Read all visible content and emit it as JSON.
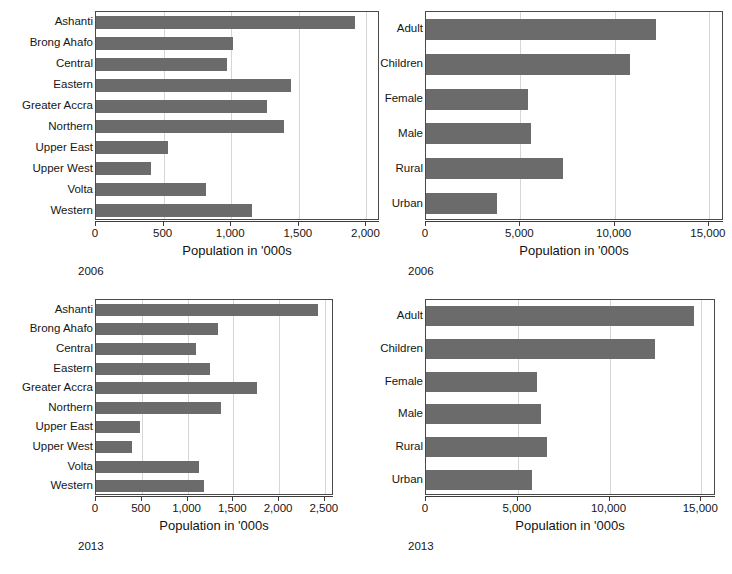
{
  "figure": {
    "bar_color": "#6b6b6b",
    "frame_color": "#4a4a4a",
    "grid_color": "#d6d6d6",
    "axis_title": "Population in '000s"
  },
  "panels": [
    {
      "id": "regions-2006",
      "caption": "2006",
      "axis_title": "Population in '000s"
    },
    {
      "id": "groups-2006",
      "caption": "2006",
      "axis_title": "Population in '000s"
    },
    {
      "id": "regions-2013",
      "caption": "2013",
      "axis_title": "Population in '000s"
    },
    {
      "id": "groups-2013",
      "caption": "2013",
      "axis_title": "Population in '000s"
    }
  ],
  "chart_data": [
    {
      "type": "bar",
      "orientation": "horizontal",
      "title": "",
      "subtitle": "2006",
      "xlabel": "Population in '000s",
      "ylabel": "",
      "xlim": [
        0,
        2100
      ],
      "xticks": [
        0,
        500,
        1000,
        1500,
        2000
      ],
      "xticklabels": [
        "0",
        "500",
        "1,000",
        "1,500",
        "2,000"
      ],
      "grid": true,
      "legend": "none",
      "categories": [
        "Ashanti",
        "Brong Ahafo",
        "Central",
        "Eastern",
        "Greater Accra",
        "Northern",
        "Upper East",
        "Upper West",
        "Volta",
        "Western"
      ],
      "values": [
        1915,
        1015,
        970,
        1440,
        1265,
        1390,
        535,
        405,
        810,
        1150
      ]
    },
    {
      "type": "bar",
      "orientation": "horizontal",
      "title": "",
      "subtitle": "2006",
      "xlabel": "Population in '000s",
      "ylabel": "",
      "xlim": [
        0,
        15800
      ],
      "xticks": [
        0,
        5000,
        10000,
        15000
      ],
      "xticklabels": [
        "0",
        "5,000",
        "10,000",
        "15,000"
      ],
      "grid": true,
      "legend": "none",
      "categories": [
        "Adult",
        "Children",
        "Female",
        "Male",
        "Rural",
        "Urban"
      ],
      "values": [
        12200,
        10800,
        5400,
        5580,
        7250,
        3740
      ]
    },
    {
      "type": "bar",
      "orientation": "horizontal",
      "title": "",
      "subtitle": "2013",
      "xlabel": "Population in '000s",
      "ylabel": "",
      "xlim": [
        0,
        2600
      ],
      "xticks": [
        0,
        500,
        1000,
        1500,
        2000,
        2500
      ],
      "xticklabels": [
        "0",
        "500",
        "1,000",
        "1,500",
        "2,000",
        "2,500"
      ],
      "grid": true,
      "legend": "none",
      "categories": [
        "Ashanti",
        "Brong Ahafo",
        "Central",
        "Eastern",
        "Greater Accra",
        "Northern",
        "Upper East",
        "Upper West",
        "Volta",
        "Western"
      ],
      "values": [
        2420,
        1330,
        1090,
        1250,
        1760,
        1370,
        485,
        390,
        1130,
        1185
      ]
    },
    {
      "type": "bar",
      "orientation": "horizontal",
      "title": "",
      "subtitle": "2013",
      "xlabel": "Population in '000s",
      "ylabel": "",
      "xlim": [
        0,
        15800
      ],
      "xticks": [
        0,
        5000,
        10000,
        15000
      ],
      "xticklabels": [
        "0",
        "5,000",
        "10,000",
        "15,000"
      ],
      "grid": true,
      "legend": "none",
      "categories": [
        "Adult",
        "Children",
        "Female",
        "Male",
        "Rural",
        "Urban"
      ],
      "values": [
        14600,
        12450,
        6070,
        6290,
        6610,
        5750
      ]
    }
  ]
}
